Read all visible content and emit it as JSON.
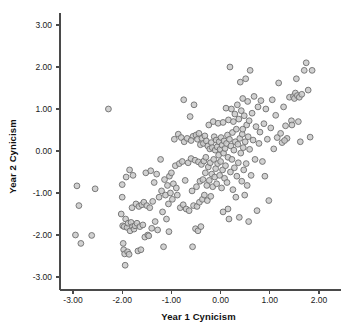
{
  "chart_data": {
    "type": "scatter",
    "title": "",
    "xlabel": "Year 1 Cynicism",
    "ylabel": "Year 2 Cynicism",
    "xlim": [
      -3.4,
      2.35
    ],
    "ylim": [
      -3.3,
      3.35
    ],
    "xticks": [
      -3.0,
      -2.0,
      -1.0,
      0.0,
      1.0,
      2.0
    ],
    "yticks": [
      3.0,
      2.0,
      1.0,
      0.0,
      -1.0,
      -2.0,
      -3.0
    ],
    "xtick_labels": [
      "-3.00",
      "-2.00",
      "-1.00",
      "0.00",
      "1.00",
      "2.00"
    ],
    "ytick_labels": [
      "3.00",
      "2.00",
      "1.00",
      "0.00",
      "-1.00",
      "-2.00",
      "-3.00"
    ],
    "grid": false,
    "legend": null,
    "marker": {
      "shape": "circle",
      "fill": "#c9c9c9",
      "stroke": "#6e6e6e",
      "radius": 2.9,
      "stroke_width": 0.9
    },
    "axis_color": "#4a4a4a",
    "n_points": 253,
    "points": [
      [
        -2.95,
        -2.0
      ],
      [
        -2.92,
        -0.83
      ],
      [
        -2.88,
        -1.3
      ],
      [
        -2.84,
        -2.2
      ],
      [
        -2.62,
        -2.01
      ],
      [
        -2.55,
        -0.9
      ],
      [
        -2.28,
        1.0
      ],
      [
        -2.02,
        -1.5
      ],
      [
        -2.0,
        -0.8
      ],
      [
        -2.0,
        -1.1
      ],
      [
        -1.99,
        -1.78
      ],
      [
        -1.98,
        -2.2
      ],
      [
        -1.97,
        -2.35
      ],
      [
        -1.96,
        -1.8
      ],
      [
        -1.95,
        -2.45
      ],
      [
        -1.94,
        -2.72
      ],
      [
        -1.93,
        -1.62
      ],
      [
        -1.92,
        -0.62
      ],
      [
        -1.9,
        -1.82
      ],
      [
        -1.89,
        -2.4
      ],
      [
        -1.88,
        -1.72
      ],
      [
        -1.86,
        -2.46
      ],
      [
        -1.85,
        -0.45
      ],
      [
        -1.84,
        -1.9
      ],
      [
        -1.82,
        -1.7
      ],
      [
        -1.8,
        -1.35
      ],
      [
        -1.79,
        -1.8
      ],
      [
        -1.78,
        -0.58
      ],
      [
        -1.76,
        -1.86
      ],
      [
        -1.74,
        -1.78
      ],
      [
        -1.72,
        -1.26
      ],
      [
        -1.7,
        -1.72
      ],
      [
        -1.68,
        -2.38
      ],
      [
        -1.66,
        -1.32
      ],
      [
        -1.64,
        -1.8
      ],
      [
        -1.62,
        -2.35
      ],
      [
        -1.6,
        -1.28
      ],
      [
        -1.58,
        -1.76
      ],
      [
        -1.56,
        -1.22
      ],
      [
        -1.54,
        -2.05
      ],
      [
        -1.52,
        -0.52
      ],
      [
        -1.5,
        -1.3
      ],
      [
        -1.48,
        -2.0
      ],
      [
        -1.46,
        -2.02
      ],
      [
        -1.44,
        -1.35
      ],
      [
        -1.42,
        -0.47
      ],
      [
        -1.4,
        -1.84
      ],
      [
        -1.38,
        -1.2
      ],
      [
        -1.35,
        -0.75
      ],
      [
        -1.33,
        -1.68
      ],
      [
        -1.3,
        -0.55
      ],
      [
        -1.28,
        -1.88
      ],
      [
        -1.25,
        -1.1
      ],
      [
        -1.22,
        -0.2
      ],
      [
        -1.2,
        -0.95
      ],
      [
        -1.18,
        -1.45
      ],
      [
        -1.16,
        -2.28
      ],
      [
        -1.14,
        -0.68
      ],
      [
        -1.12,
        -1.05
      ],
      [
        -1.1,
        -1.62
      ],
      [
        -1.08,
        -0.82
      ],
      [
        -1.06,
        -1.26
      ],
      [
        -1.04,
        -0.6
      ],
      [
        -1.02,
        -1.0
      ],
      [
        -1.0,
        -0.52
      ],
      [
        -0.98,
        -1.15
      ],
      [
        -0.96,
        -0.78
      ],
      [
        -0.94,
        0.28
      ],
      [
        -0.92,
        -0.35
      ],
      [
        -0.9,
        -0.88
      ],
      [
        -0.88,
        -1.05
      ],
      [
        -0.86,
        0.4
      ],
      [
        -0.84,
        -0.3
      ],
      [
        -0.82,
        -1.35
      ],
      [
        -0.8,
        0.32
      ],
      [
        -0.78,
        -0.25
      ],
      [
        -0.76,
        -1.28
      ],
      [
        -0.75,
        1.22
      ],
      [
        -0.74,
        0.22
      ],
      [
        -0.72,
        -0.7
      ],
      [
        -0.7,
        -1.38
      ],
      [
        -0.68,
        0.3
      ],
      [
        -0.66,
        -0.28
      ],
      [
        -0.64,
        -1.42
      ],
      [
        -0.62,
        0.82
      ],
      [
        -0.6,
        -0.18
      ],
      [
        -0.58,
        -0.95
      ],
      [
        -0.57,
        -2.28
      ],
      [
        -0.56,
        0.35
      ],
      [
        -0.55,
        -1.3
      ],
      [
        -0.54,
        1.1
      ],
      [
        -0.52,
        -0.22
      ],
      [
        -0.51,
        -1.85
      ],
      [
        -0.5,
        0.38
      ],
      [
        -0.49,
        -0.85
      ],
      [
        -0.48,
        -1.32
      ],
      [
        -0.47,
        0.28
      ],
      [
        -0.46,
        -1.9
      ],
      [
        -0.45,
        -0.26
      ],
      [
        -0.44,
        0.42
      ],
      [
        -0.43,
        -1.22
      ],
      [
        -0.42,
        -0.72
      ],
      [
        -0.41,
        0.15
      ],
      [
        -0.4,
        -1.8
      ],
      [
        -0.39,
        -0.32
      ],
      [
        -0.38,
        0.3
      ],
      [
        -0.37,
        -1.15
      ],
      [
        -0.36,
        -0.68
      ],
      [
        -0.35,
        0.18
      ],
      [
        -0.34,
        -0.24
      ],
      [
        -0.33,
        -1.05
      ],
      [
        -0.32,
        0.36
      ],
      [
        -0.31,
        -0.52
      ],
      [
        -0.3,
        -0.15
      ],
      [
        -0.29,
        0.24
      ],
      [
        -0.28,
        -0.82
      ],
      [
        -0.27,
        -1.18
      ],
      [
        -0.26,
        0.12
      ],
      [
        -0.25,
        -0.38
      ],
      [
        -0.24,
        0.62
      ],
      [
        -0.23,
        -0.7
      ],
      [
        -0.22,
        0.05
      ],
      [
        -0.21,
        -0.28
      ],
      [
        -0.2,
        -1.08
      ],
      [
        -0.19,
        0.2
      ],
      [
        -0.18,
        -0.55
      ],
      [
        -0.17,
        0.08
      ],
      [
        -0.16,
        -0.85
      ],
      [
        -0.15,
        0.7
      ],
      [
        -0.14,
        -0.2
      ],
      [
        -0.13,
        0.34
      ],
      [
        -0.12,
        -0.62
      ],
      [
        -0.11,
        0.02
      ],
      [
        -0.1,
        -0.42
      ],
      [
        -0.09,
        0.26
      ],
      [
        -0.08,
        -0.78
      ],
      [
        -0.07,
        0.1
      ],
      [
        -0.06,
        -0.3
      ],
      [
        -0.05,
        0.66
      ],
      [
        -0.04,
        -0.1
      ],
      [
        -0.03,
        0.22
      ],
      [
        -0.02,
        -0.58
      ],
      [
        -0.01,
        0.04
      ],
      [
        0.0,
        -0.25
      ],
      [
        0.01,
        0.32
      ],
      [
        0.02,
        -0.88
      ],
      [
        0.03,
        0.14
      ],
      [
        0.04,
        -0.45
      ],
      [
        0.05,
        0.68
      ],
      [
        0.06,
        -0.05
      ],
      [
        0.07,
        0.24
      ],
      [
        0.08,
        -0.65
      ],
      [
        0.09,
        0.06
      ],
      [
        0.1,
        -0.35
      ],
      [
        0.11,
        1.02
      ],
      [
        0.12,
        0.18
      ],
      [
        0.13,
        -0.75
      ],
      [
        0.14,
        0.38
      ],
      [
        0.15,
        -0.15
      ],
      [
        0.16,
        0.74
      ],
      [
        0.17,
        -1.62
      ],
      [
        0.18,
        0.28
      ],
      [
        0.19,
        2.0
      ],
      [
        0.2,
        -0.5
      ],
      [
        0.21,
        0.12
      ],
      [
        0.22,
        1.0
      ],
      [
        0.23,
        -0.2
      ],
      [
        0.24,
        0.44
      ],
      [
        0.25,
        -0.92
      ],
      [
        0.26,
        0.7
      ],
      [
        0.27,
        0.02
      ],
      [
        0.28,
        -0.4
      ],
      [
        0.29,
        0.88
      ],
      [
        0.3,
        0.22
      ],
      [
        0.31,
        -1.1
      ],
      [
        0.32,
        0.52
      ],
      [
        0.33,
        -0.6
      ],
      [
        0.34,
        1.1
      ],
      [
        0.35,
        0.16
      ],
      [
        0.36,
        -0.28
      ],
      [
        0.37,
        0.76
      ],
      [
        0.38,
        -1.58
      ],
      [
        0.39,
        0.3
      ],
      [
        0.4,
        1.64
      ],
      [
        0.41,
        -0.05
      ],
      [
        0.42,
        0.96
      ],
      [
        0.43,
        -0.72
      ],
      [
        0.44,
        0.4
      ],
      [
        0.45,
        1.25
      ],
      [
        0.46,
        0.08
      ],
      [
        0.47,
        -0.45
      ],
      [
        0.48,
        0.84
      ],
      [
        0.49,
        -1.05
      ],
      [
        0.5,
        0.22
      ],
      [
        0.51,
        1.72
      ],
      [
        0.52,
        -0.3
      ],
      [
        0.53,
        0.62
      ],
      [
        0.54,
        -0.82
      ],
      [
        0.55,
        1.18
      ],
      [
        0.56,
        0.34
      ],
      [
        0.57,
        -1.68
      ],
      [
        0.58,
        0.72
      ],
      [
        0.59,
        0.04
      ],
      [
        0.6,
        1.92
      ],
      [
        0.62,
        -0.58
      ],
      [
        0.64,
        0.9
      ],
      [
        0.66,
        0.26
      ],
      [
        0.68,
        1.3
      ],
      [
        0.7,
        -0.2
      ],
      [
        0.72,
        0.58
      ],
      [
        0.74,
        -1.42
      ],
      [
        0.76,
        1.05
      ],
      [
        0.78,
        0.18
      ],
      [
        0.8,
        0.45
      ],
      [
        0.82,
        1.2
      ],
      [
        0.85,
        -0.25
      ],
      [
        0.88,
        0.65
      ],
      [
        0.9,
        -0.6
      ],
      [
        0.92,
        1.0
      ],
      [
        0.95,
        0.28
      ],
      [
        0.98,
        -1.18
      ],
      [
        1.02,
        0.55
      ],
      [
        1.05,
        1.22
      ],
      [
        1.08,
        0.05
      ],
      [
        1.12,
        0.85
      ],
      [
        1.15,
        0.32
      ],
      [
        1.18,
        1.62
      ],
      [
        1.22,
        0.42
      ],
      [
        1.25,
        0.2
      ],
      [
        1.28,
        1.05
      ],
      [
        1.32,
        0.6
      ],
      [
        1.35,
        0.3
      ],
      [
        1.4,
        1.28
      ],
      [
        1.44,
        0.72
      ],
      [
        1.48,
        1.3
      ],
      [
        1.5,
        1.25
      ],
      [
        1.52,
        1.38
      ],
      [
        1.54,
        1.72
      ],
      [
        1.56,
        1.32
      ],
      [
        1.58,
        0.7
      ],
      [
        1.6,
        1.28
      ],
      [
        1.62,
        0.22
      ],
      [
        1.65,
        1.35
      ],
      [
        1.7,
        1.92
      ],
      [
        1.74,
        2.1
      ],
      [
        1.78,
        1.45
      ],
      [
        1.82,
        0.33
      ],
      [
        1.86,
        1.92
      ],
      [
        1.45,
        0.62
      ],
      [
        1.3,
        0.25
      ],
      [
        0.45,
        0.52
      ],
      [
        0.15,
        -1.38
      ],
      [
        0.05,
        -1.45
      ],
      [
        -0.6,
        0.25
      ],
      [
        -1.05,
        -1.92
      ]
    ]
  }
}
